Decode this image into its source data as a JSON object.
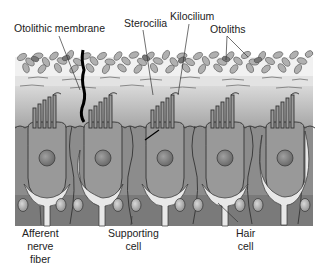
{
  "figure": {
    "labels": {
      "otolithic_membrane": "Otolithic membrane",
      "sterocilia": "Sterocilia",
      "kilocilium": "Kilocilium",
      "otoliths": "Otoliths",
      "afferent_nerve_fiber": [
        "Afferent",
        "nerve",
        "fiber"
      ],
      "supporting_cell": [
        "Supporting",
        "cell"
      ],
      "hair_cell": [
        "Hair",
        "cell"
      ]
    },
    "colors": {
      "background": "#ffffff",
      "otolith_fill": "#a9a9a9",
      "gel_layer": "#c8c8c8",
      "cell_fill": "#8f8f8f",
      "base_layer": "#7a7a7a",
      "nerve_fill": "#e6e6e6",
      "nucleus": "#7d7d7d",
      "outline": "#333333",
      "text": "#222222"
    },
    "hair_cell_count": 5
  }
}
